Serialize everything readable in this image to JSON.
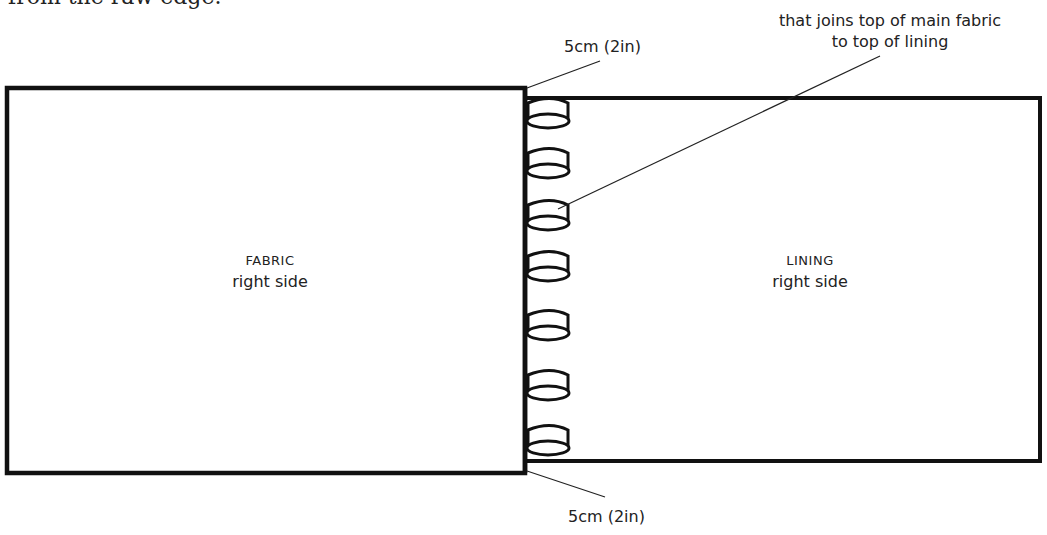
{
  "intro_text": "from the raw edge.",
  "fabric": {
    "title": "FABRIC",
    "subtitle": "right side"
  },
  "lining": {
    "title": "LINING",
    "subtitle": "right side"
  },
  "annotations": {
    "top_offset": "5cm (2in)",
    "bottom_offset": "5cm (2in)",
    "loop_note_line1": "that joins top of main fabric",
    "loop_note_line2": "to top of lining"
  },
  "loops": {
    "count": 7,
    "y_positions": [
      113,
      165,
      215,
      266,
      325,
      385,
      440
    ]
  },
  "colors": {
    "stroke": "#111111",
    "background": "#ffffff",
    "text": "#222222"
  }
}
